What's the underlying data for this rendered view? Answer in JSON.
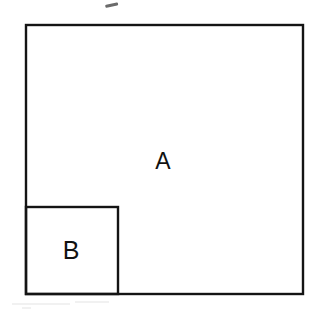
{
  "figure": {
    "background_color": "#ffffff",
    "stroke_color": "#141414",
    "label_color": "#111111",
    "shapes": [
      {
        "id": "outer-square",
        "name": "square-a",
        "label": "A",
        "x": 26,
        "y": 25,
        "width": 277,
        "height": 269,
        "stroke_width": 2.4,
        "label_x": 163,
        "label_y": 163
      },
      {
        "id": "inner-square",
        "name": "square-b",
        "label": "B",
        "x": 26,
        "y": 207,
        "width": 92,
        "height": 87,
        "stroke_width": 2.4,
        "label_x": 71,
        "label_y": 252
      }
    ],
    "marks": [
      {
        "id": "stray-dash",
        "name": "stray-dash-mark",
        "x": 105,
        "y": 5,
        "width": 13,
        "height": 3,
        "rotation": -12,
        "color": "#6b6b6b"
      }
    ],
    "specks": [
      {
        "x": 12,
        "y": 303,
        "width": 58,
        "height": 2
      },
      {
        "x": 75,
        "y": 301,
        "width": 34,
        "height": 2
      },
      {
        "x": 22,
        "y": 307,
        "width": 9,
        "height": 2
      }
    ]
  }
}
